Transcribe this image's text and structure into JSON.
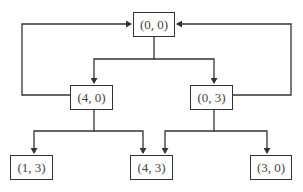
{
  "diagram": {
    "type": "state-transition-tree",
    "nodes": [
      {
        "id": "root",
        "label": "(0, 0)",
        "x": 133,
        "y": 12,
        "w": 42,
        "h": 25
      },
      {
        "id": "n40",
        "label": "(4, 0)",
        "x": 70,
        "y": 85,
        "w": 43,
        "h": 25
      },
      {
        "id": "n03",
        "label": "(0, 3)",
        "x": 190,
        "y": 85,
        "w": 43,
        "h": 25
      },
      {
        "id": "n13",
        "label": "(1, 3)",
        "x": 10,
        "y": 155,
        "w": 43,
        "h": 25
      },
      {
        "id": "n43",
        "label": "(4, 3)",
        "x": 130,
        "y": 155,
        "w": 43,
        "h": 25
      },
      {
        "id": "n30",
        "label": "(3, 0)",
        "x": 250,
        "y": 155,
        "w": 42,
        "h": 25
      }
    ],
    "edges": [
      {
        "from": "(0, 0)",
        "to": "(4, 0)"
      },
      {
        "from": "(0, 0)",
        "to": "(0, 3)"
      },
      {
        "from": "(4, 0)",
        "to": "(0, 0)",
        "kind": "loop-back-left"
      },
      {
        "from": "(0, 3)",
        "to": "(0, 0)",
        "kind": "loop-back-right"
      },
      {
        "from": "(4, 0)",
        "to": "(1, 3)"
      },
      {
        "from": "(4, 0)",
        "to": "(4, 3)"
      },
      {
        "from": "(0, 3)",
        "to": "(4, 3)"
      },
      {
        "from": "(0, 3)",
        "to": "(3, 0)"
      }
    ],
    "line_color": "#333333"
  }
}
